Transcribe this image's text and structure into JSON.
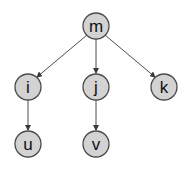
{
  "diagram": {
    "type": "tree",
    "directed": true,
    "colors": {
      "node_fill": "#d3d3d3",
      "node_stroke": "#4a4a4a",
      "edge": "#3a3a3a",
      "label": "#111111",
      "background": "#ffffff"
    },
    "nodes": [
      {
        "id": "m",
        "label": "m",
        "x": 96,
        "y": 26
      },
      {
        "id": "i",
        "label": "i",
        "x": 28,
        "y": 87
      },
      {
        "id": "j",
        "label": "j",
        "x": 96,
        "y": 87
      },
      {
        "id": "k",
        "label": "k",
        "x": 164,
        "y": 87
      },
      {
        "id": "u",
        "label": "u",
        "x": 28,
        "y": 144
      },
      {
        "id": "v",
        "label": "v",
        "x": 96,
        "y": 144
      }
    ],
    "edges": [
      {
        "from": "m",
        "to": "i"
      },
      {
        "from": "m",
        "to": "j"
      },
      {
        "from": "m",
        "to": "k"
      },
      {
        "from": "i",
        "to": "u"
      },
      {
        "from": "j",
        "to": "v"
      }
    ]
  }
}
